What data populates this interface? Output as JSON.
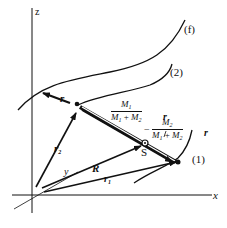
{
  "diagram": {
    "axes": {
      "x": "x",
      "y": "y",
      "z": "z"
    },
    "curves": {
      "curve_f": "(f)",
      "curve_2": "(2)",
      "curve_1": "(1)"
    },
    "vectors": {
      "r": "r",
      "r1": "r",
      "r1_sub": "1",
      "r2": "r",
      "r2_sub": "2",
      "R": "R"
    },
    "points": {
      "S": "S"
    },
    "fractions": {
      "upper": {
        "numerator": "M",
        "numerator_sub": "1",
        "den_a": "M",
        "den_a_sub": "1",
        "plus": " + ",
        "den_b": "M",
        "den_b_sub": "2",
        "suffix": "r"
      },
      "lower": {
        "prefix": "−",
        "numerator": "M",
        "numerator_sub": "2",
        "den_a": "M",
        "den_a_sub": "1",
        "plus": " + ",
        "den_b": "M",
        "den_b_sub": "2",
        "suffix": "r"
      }
    },
    "colors": {
      "ink": "#111111",
      "background": "#ffffff"
    }
  }
}
